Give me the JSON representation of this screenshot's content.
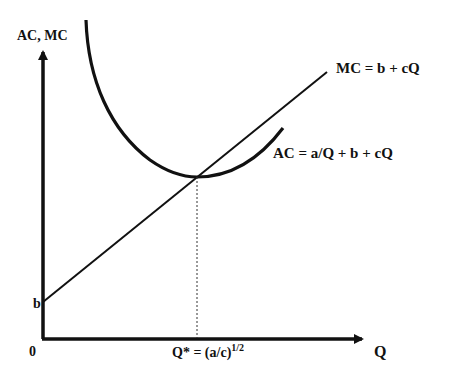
{
  "diagram": {
    "y_axis_label": "AC, MC",
    "x_axis_label": "Q",
    "origin_label": "0",
    "intercept_label": "b",
    "mc_label": "MC = b + cQ",
    "ac_label": "AC = a/Q + b + cQ",
    "qstar_label_base": "Q* = (a/c)",
    "qstar_label_exp": "1/2",
    "colors": {
      "ink": "#111111",
      "background": "#ffffff"
    }
  }
}
